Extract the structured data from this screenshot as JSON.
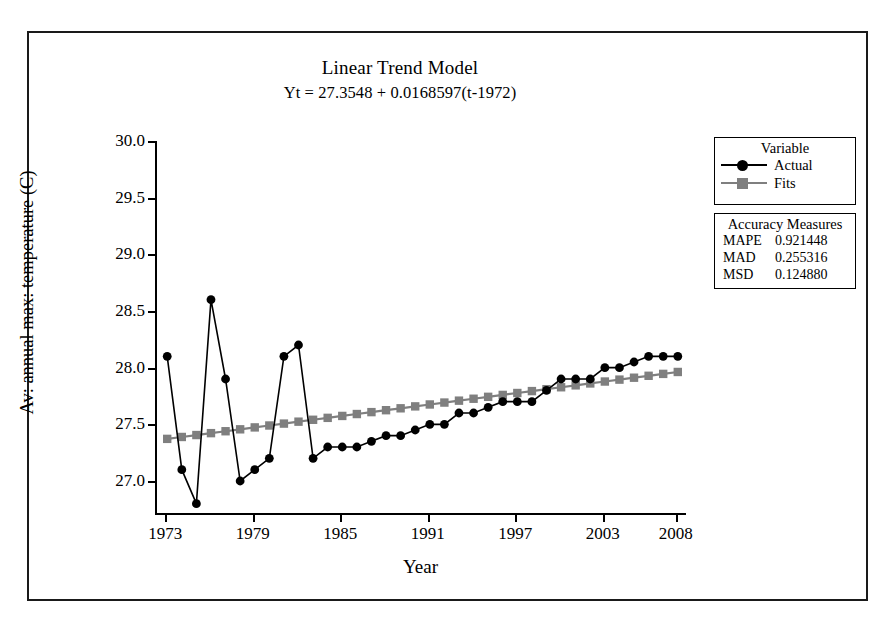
{
  "chart_data": {
    "type": "line",
    "title": "Linear Trend Model",
    "subtitle": "Yt = 27.3548 + 0.0168597(t-1972)",
    "xlabel": "Year",
    "ylabel": "Av: annual max: temperature (C)",
    "xlim": [
      1972.3,
      2008.7
    ],
    "ylim": [
      26.7,
      30.0
    ],
    "grid": false,
    "legend_position": "right",
    "y_ticks": [
      "27.0",
      "27.5",
      "28.0",
      "28.5",
      "29.0",
      "29.5",
      "30.0"
    ],
    "y_tick_values": [
      27.0,
      27.5,
      28.0,
      28.5,
      29.0,
      29.5,
      30.0
    ],
    "x_ticks": [
      "1973",
      "1979",
      "1985",
      "1991",
      "1997",
      "2003",
      "2008"
    ],
    "x_tick_values": [
      1973,
      1979,
      1985,
      1991,
      1997,
      2003,
      2008
    ],
    "x": [
      1973,
      1974,
      1975,
      1976,
      1977,
      1978,
      1979,
      1980,
      1981,
      1982,
      1983,
      1984,
      1985,
      1986,
      1987,
      1988,
      1989,
      1990,
      1991,
      1992,
      1993,
      1994,
      1995,
      1996,
      1997,
      1998,
      1999,
      2000,
      2001,
      2002,
      2003,
      2004,
      2005,
      2006,
      2007,
      2008
    ],
    "series": [
      {
        "name": "Actual",
        "color": "#000000",
        "marker": "circle",
        "values": [
          28.1,
          27.1,
          26.8,
          28.6,
          27.9,
          27.0,
          27.1,
          27.2,
          28.1,
          28.2,
          27.2,
          27.3,
          27.3,
          27.3,
          27.35,
          27.4,
          27.4,
          27.45,
          27.5,
          27.5,
          27.6,
          27.6,
          27.65,
          27.7,
          27.7,
          27.7,
          27.8,
          27.9,
          27.9,
          27.9,
          28.0,
          28.0,
          28.05,
          28.1,
          28.1,
          28.1
        ]
      },
      {
        "name": "Fits",
        "color": "#7f7f7f",
        "marker": "square",
        "values": [
          27.3717,
          27.3885,
          27.4054,
          27.4223,
          27.4391,
          27.456,
          27.4729,
          27.4897,
          27.5066,
          27.5235,
          27.5403,
          27.5572,
          27.5741,
          27.5909,
          27.6078,
          27.6247,
          27.6415,
          27.6584,
          27.6753,
          27.6921,
          27.709,
          27.7259,
          27.7427,
          27.7596,
          27.7765,
          27.7933,
          27.8102,
          27.8271,
          27.8439,
          27.8608,
          27.8777,
          27.8945,
          27.9114,
          27.9283,
          27.9451,
          27.962
        ]
      }
    ],
    "annotations": {
      "model_equation": "Yt = 27.3548 + 0.0168597(t-1972)",
      "intercept": 27.3548,
      "slope": 0.0168597,
      "base_year": 1972
    }
  },
  "legend": {
    "heading": "Variable",
    "items": [
      {
        "label": "Actual",
        "color": "#000000",
        "marker": "circle"
      },
      {
        "label": "Fits",
        "color": "#7f7f7f",
        "marker": "square"
      }
    ]
  },
  "accuracy": {
    "heading": "Accuracy Measures",
    "rows": [
      {
        "name": "MAPE",
        "value": "0.921448"
      },
      {
        "name": "MAD",
        "value": "0.255316"
      },
      {
        "name": "MSD",
        "value": "0.124880"
      }
    ]
  },
  "colors": {
    "actual": "#000000",
    "fits": "#7f7f7f",
    "axis": "#000000",
    "background": "#ffffff"
  }
}
